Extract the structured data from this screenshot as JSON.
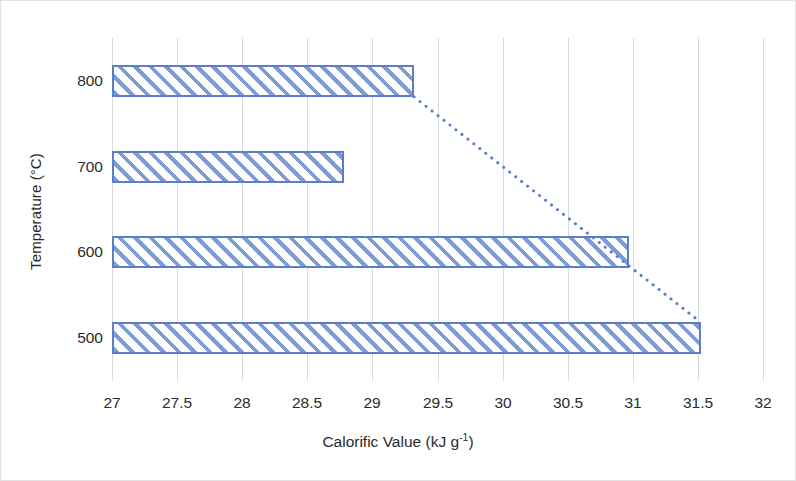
{
  "chart_data": {
    "type": "bar",
    "orientation": "horizontal",
    "title": "",
    "xlabel": "Calorific Value (kJ g-1)",
    "xlabel_base": "Calorific Value (kJ g",
    "xlabel_sup": "-1",
    "xlabel_tail": ")",
    "ylabel": "Temperature (°C)",
    "categories": [
      "800",
      "700",
      "600",
      "500"
    ],
    "values": [
      29.32,
      28.78,
      30.97,
      31.52
    ],
    "xlim": [
      27,
      32
    ],
    "xticks": [
      "27",
      "27.5",
      "28",
      "28.5",
      "29",
      "29.5",
      "30",
      "30.5",
      "31",
      "31.5",
      "32"
    ],
    "xtick_values": [
      27,
      27.5,
      28,
      28.5,
      29,
      29.5,
      30,
      30.5,
      31,
      31.5,
      32
    ],
    "yticks": [
      "800",
      "700",
      "600",
      "500"
    ],
    "grid": "vertical",
    "legend": "none",
    "series": [
      {
        "name": "Calorific Value",
        "values": [
          29.32,
          28.78,
          30.97,
          31.52
        ],
        "fill": "diagonal-hatch",
        "bar_color": "#7d9cd6",
        "bar_border_color": "#5b7fc7"
      }
    ],
    "annotations": [
      {
        "type": "trendline",
        "style": "dotted",
        "color": "#5b7fc7",
        "from": {
          "x": 29.32,
          "category": "800"
        },
        "to": {
          "x": 31.52,
          "category": "500"
        }
      }
    ],
    "gridline_color": "#d9d9d9",
    "background_color": "#ffffff",
    "text_color": "#2b2b2b"
  }
}
